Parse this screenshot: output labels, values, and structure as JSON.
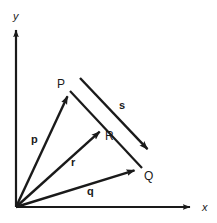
{
  "figure": {
    "type": "vector-diagram",
    "background_color": "#ffffff",
    "ink_color": "#1a1a1a",
    "axes": {
      "origin": {
        "x": 16,
        "y": 207
      },
      "x_axis": {
        "label": "x",
        "label_pos": {
          "x": 202,
          "y": 211
        },
        "from": {
          "x": 16,
          "y": 207
        },
        "to": {
          "x": 192,
          "y": 207
        }
      },
      "y_axis": {
        "label": "y",
        "label_pos": {
          "x": 13,
          "y": 20
        },
        "from": {
          "x": 16,
          "y": 207
        },
        "to": {
          "x": 16,
          "y": 28
        }
      }
    },
    "points": [
      {
        "name": "P",
        "label": "P",
        "x": 70,
        "y": 91,
        "label_pos": {
          "x": 57,
          "y": 88
        }
      },
      {
        "name": "Q",
        "label": "Q",
        "x": 142,
        "y": 168,
        "label_pos": {
          "x": 144,
          "y": 180
        }
      },
      {
        "name": "R",
        "label": "R",
        "x": 105,
        "y": 127,
        "label_pos": {
          "x": 105,
          "y": 140
        }
      }
    ],
    "vectors": [
      {
        "name": "p",
        "label": "p",
        "label_pos": {
          "x": 31,
          "y": 143
        },
        "from": {
          "x": 16,
          "y": 207
        },
        "to": {
          "x": 70,
          "y": 91
        }
      },
      {
        "name": "q",
        "label": "q",
        "label_pos": {
          "x": 87,
          "y": 195
        },
        "from": {
          "x": 16,
          "y": 207
        },
        "to": {
          "x": 142,
          "y": 168
        }
      },
      {
        "name": "r",
        "label": "r",
        "label_pos": {
          "x": 71,
          "y": 166
        },
        "from": {
          "x": 16,
          "y": 207
        },
        "to": {
          "x": 105,
          "y": 127
        }
      },
      {
        "name": "s",
        "label": "s",
        "label_pos": {
          "x": 119,
          "y": 109
        },
        "from": {
          "x": 80,
          "y": 78
        },
        "to": {
          "x": 153,
          "y": 155
        }
      }
    ],
    "segments": [
      {
        "name": "side-PQ",
        "from": {
          "x": 70,
          "y": 91
        },
        "to": {
          "x": 142,
          "y": 168
        }
      }
    ]
  }
}
